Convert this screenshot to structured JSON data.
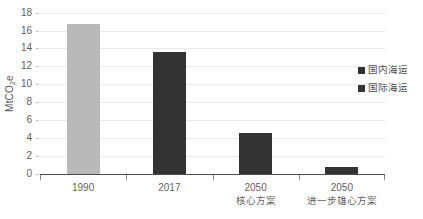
{
  "chart_data": {
    "type": "bar",
    "title": "",
    "xlabel": "",
    "ylabel": "MtCO2e",
    "ylabel_parts": {
      "prefix": "MtCO",
      "sub": "2",
      "suffix": "e"
    },
    "categories": [
      "1990",
      "2017",
      "2050",
      "2050"
    ],
    "category_sublabels": [
      "",
      "",
      "核心方案",
      "进一步雄心方案"
    ],
    "values": [
      16.7,
      13.6,
      4.6,
      0.7
    ],
    "series": [
      {
        "name": "国内海运",
        "values": [
          null,
          13.6,
          4.6,
          0.7
        ],
        "color": "#333333"
      },
      {
        "name": "国际海运",
        "values": [
          16.7,
          null,
          null,
          null
        ],
        "color": "#b9b9b9"
      }
    ],
    "bar_colors": [
      "#b9b9b9",
      "#333333",
      "#333333",
      "#333333"
    ],
    "ylim": [
      0,
      18
    ],
    "yticks": [
      0,
      2,
      4,
      6,
      8,
      10,
      12,
      14,
      16,
      18
    ],
    "ytick_labels": [
      "0",
      "2",
      "4",
      "6",
      "8",
      "10",
      "12",
      "14",
      "16",
      "18"
    ],
    "grid": true,
    "grid_color": "#e8e8e8",
    "legend_position": "right",
    "legend": [
      {
        "label": "国内海运",
        "color": "#333333"
      },
      {
        "label": "国际海运",
        "color": "#333333"
      }
    ],
    "axis_color": "#4d4d4d",
    "text_color": "#5f5f5f",
    "background": "#ffffff"
  }
}
